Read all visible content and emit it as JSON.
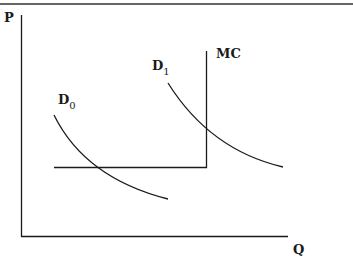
{
  "diagram": {
    "type": "economics supply-demand diagram",
    "axes": {
      "y_label": "P",
      "x_label": "Q"
    },
    "curves": {
      "mc": {
        "label": "MC"
      },
      "d0": {
        "label_main": "D",
        "label_sub": "0"
      },
      "d1": {
        "label_main": "D",
        "label_sub": "1"
      }
    },
    "colors": {
      "line": "#1a1a1a",
      "background": "#ffffff"
    }
  }
}
